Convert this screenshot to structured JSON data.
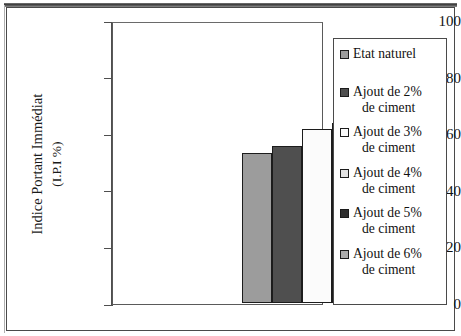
{
  "chart_data": {
    "type": "bar",
    "title": "",
    "xlabel": "",
    "ylabel": "Indice Portant Immédiat (I.P.I %)",
    "ylabel_line1": "Indice Portant Immédiat",
    "ylabel_line2": "(I.P.I %)",
    "categories": [
      "Etat naturel",
      "Ajout de 2% de ciment",
      "Ajout de 3% de ciment",
      "Ajout de 4% de ciment",
      "Ajout de 5% de ciment",
      "Ajout de 6% de ciment"
    ],
    "values": [
      53,
      55.5,
      61.5,
      63.5,
      64.5,
      69.5
    ],
    "colors": [
      "#9c9c9c",
      "#4f4f4f",
      "#fbfbfb",
      "#e2e2e2",
      "#2e2e2e",
      "#adadad"
    ],
    "ylim": [
      0,
      100
    ],
    "yticks": [
      100,
      80,
      60,
      40,
      20,
      0
    ],
    "ytick_labels": [
      "100",
      "80",
      "60",
      "40",
      "20",
      "0"
    ],
    "grid": false,
    "legend_position": "right",
    "xtick_labels": []
  },
  "legend": {
    "items": [
      {
        "label_line1": "Etat naturel",
        "label_line2": "",
        "swatch": "#9c9c9c"
      },
      {
        "label_line1": "Ajout de 2%",
        "label_line2": "de ciment",
        "swatch": "#4f4f4f"
      },
      {
        "label_line1": "Ajout de 3%",
        "label_line2": "de ciment",
        "swatch": "#fbfbfb"
      },
      {
        "label_line1": "Ajout de 4%",
        "label_line2": "de ciment",
        "swatch": "#e2e2e2"
      },
      {
        "label_line1": "Ajout de 5%",
        "label_line2": "de ciment",
        "swatch": "#2e2e2e"
      },
      {
        "label_line1": "Ajout de 6%",
        "label_line2": "de ciment",
        "swatch": "#adadad"
      }
    ]
  }
}
